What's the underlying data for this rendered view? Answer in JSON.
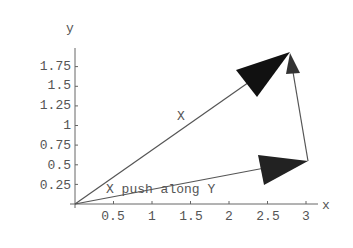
{
  "diagram": {
    "type": "vector-plot",
    "axes": {
      "x_label": "x",
      "y_label": "y",
      "x_ticks": [
        "0.5",
        "1",
        "1.5",
        "2",
        "2.5",
        "3"
      ],
      "y_ticks": [
        "0.25",
        "0.5",
        "0.75",
        "1",
        "1.25",
        "1.5",
        "1.75"
      ]
    },
    "vectors": [
      {
        "name": "X",
        "label": "X",
        "from": [
          0,
          0
        ],
        "to": [
          2.8,
          1.93
        ]
      },
      {
        "name": "X push along Y",
        "label": "X push along Y",
        "from": [
          0,
          0
        ],
        "to": [
          3.02,
          0.55
        ]
      },
      {
        "name": "connector",
        "label": "",
        "from": [
          3.02,
          0.55
        ],
        "to": [
          2.8,
          1.93
        ]
      }
    ],
    "colors": {
      "axis": "#555555",
      "arrow": "#111111",
      "text": "#555555"
    }
  }
}
